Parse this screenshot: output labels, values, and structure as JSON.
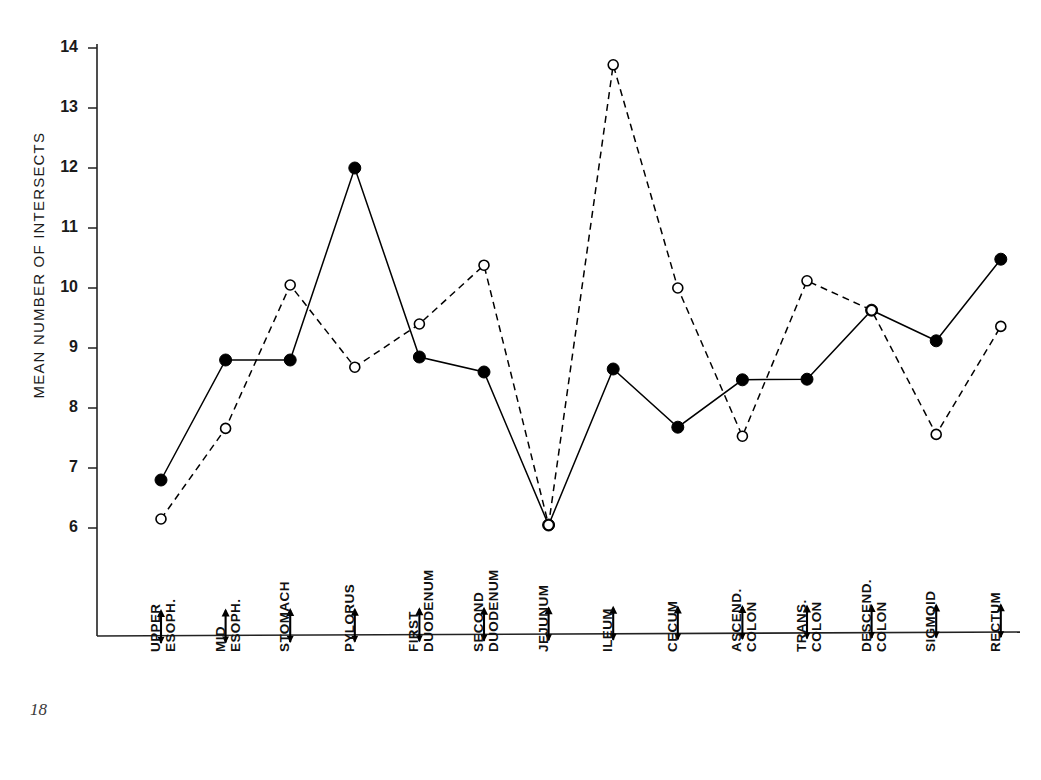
{
  "page": {
    "number": "18",
    "top_cut_text": ""
  },
  "chart_data": {
    "type": "line",
    "title": "",
    "xlabel": "",
    "ylabel": "MEAN NUMBER OF INTERSECTS",
    "ylim": [
      5.4,
      14
    ],
    "yticks": [
      6,
      7,
      8,
      9,
      10,
      11,
      12,
      13,
      14
    ],
    "ytick_labels": [
      "6",
      "7",
      "8",
      "9",
      "10",
      "11",
      "12",
      "13",
      "14"
    ],
    "grid": false,
    "legend": "none",
    "categories": [
      "UPPER ESOPH.",
      "MID ESOPH.",
      "STOMACH",
      "PYLORUS",
      "FIRST DUODENUM",
      "SECOND DUODENUM",
      "JEJUNUM",
      "ILEUM",
      "CECUM",
      "ASCEND. COLON",
      "TRANS. COLON",
      "DESCEND. COLON",
      "SIGMOID",
      "RECTUM"
    ],
    "category_lines": [
      [
        "UPPER",
        "ESOPH."
      ],
      [
        "MID",
        "ESOPH."
      ],
      [
        "STOMACH",
        ""
      ],
      [
        "PYLORUS",
        ""
      ],
      [
        "FIRST",
        "DUODENUM"
      ],
      [
        "SECOND",
        "DUODENUM"
      ],
      [
        "JEJUNUM",
        ""
      ],
      [
        "ILEUM",
        ""
      ],
      [
        "CECUM",
        ""
      ],
      [
        "ASCEND.",
        "COLON"
      ],
      [
        "TRANS.",
        "COLON"
      ],
      [
        "DESCEND.",
        "COLON"
      ],
      [
        "SIGMOID",
        ""
      ],
      [
        "RECTUM",
        ""
      ]
    ],
    "series": [
      {
        "name": "filled-solid",
        "marker": "filled-circle",
        "line_style": "solid",
        "color": "#000000",
        "values": [
          6.8,
          8.8,
          8.8,
          12.0,
          8.85,
          8.6,
          6.05,
          8.65,
          7.68,
          8.47,
          8.48,
          9.63,
          9.12,
          10.48
        ]
      },
      {
        "name": "open-dashed",
        "marker": "open-circle",
        "line_style": "dashed",
        "color": "#000000",
        "values": [
          6.15,
          7.66,
          10.05,
          8.68,
          9.4,
          10.38,
          6.05,
          13.72,
          10.0,
          7.53,
          10.12,
          9.63,
          7.56,
          9.36
        ]
      }
    ]
  }
}
